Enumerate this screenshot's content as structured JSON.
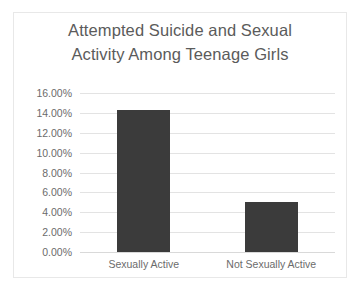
{
  "chart_data": {
    "type": "bar",
    "title": "Attempted Suicide and Sexual Activity Among Teenage Girls",
    "title_lines": [
      "Attempted Suicide and Sexual",
      "Activity Among Teenage Girls"
    ],
    "categories": [
      "Sexually Active",
      "Not Sexually Active"
    ],
    "values": [
      14.3,
      5.0
    ],
    "value_labels": [
      "14.30%",
      "5.00%"
    ],
    "xlabel": "",
    "ylabel": "",
    "ylim": [
      0,
      16
    ],
    "ytick_step": 2,
    "ytick_labels": [
      "16.00%",
      "14.00%",
      "12.00%",
      "10.00%",
      "8.00%",
      "6.00%",
      "4.00%",
      "2.00%",
      "0.00%"
    ],
    "ytick_values": [
      16,
      14,
      12,
      10,
      8,
      6,
      4,
      2,
      0
    ],
    "grid": true,
    "grid_axis": "y",
    "legend": false,
    "legend_position": "none",
    "series": [
      {
        "name": "Attempted Suicide Rate",
        "values": [
          14.3,
          5.0
        ]
      }
    ],
    "colors": {
      "bar": "#3b3b3b",
      "gridline": "#e3e3e3",
      "title_text": "#5b5b5b",
      "tick_text": "#6b6b6b",
      "plot_background": "#ffffff",
      "frame_border": "#e8e8e8"
    }
  }
}
